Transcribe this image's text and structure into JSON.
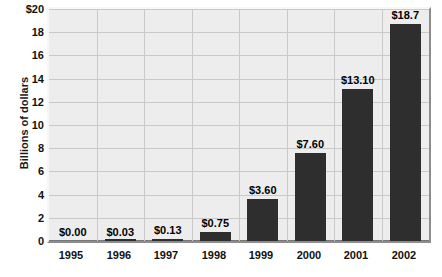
{
  "chart_data": {
    "type": "bar",
    "title": "",
    "subtitle": "",
    "xlabel": "",
    "ylabel": "Billions of dollars",
    "categories": [
      "1995",
      "1996",
      "1997",
      "1998",
      "1999",
      "2000",
      "2001",
      "2002"
    ],
    "values": [
      0.0,
      0.03,
      0.13,
      0.75,
      3.6,
      7.6,
      13.1,
      18.7
    ],
    "data_labels": [
      "$0.00",
      "$0.03",
      "$0.13",
      "$0.75",
      "$3.60",
      "$7.60",
      "$13.10",
      "$18.7"
    ],
    "ylim": [
      0,
      20
    ],
    "ytick_values": [
      20,
      18,
      16,
      14,
      12,
      10,
      8,
      6,
      4,
      2,
      0
    ],
    "ytick_labels": [
      "$20",
      "18",
      "16",
      "14",
      "12",
      "10",
      "8",
      "6",
      "4",
      "2",
      "0"
    ],
    "grid": true,
    "legend": "none",
    "colors": {
      "bar": "#2e2e2e",
      "plot_background": "#ededed",
      "gridline": "#c9c9c9",
      "axis": "#777777",
      "text": "#111111",
      "page_background": "#ffffff"
    }
  }
}
